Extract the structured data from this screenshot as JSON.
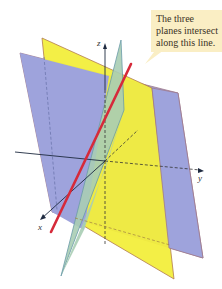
{
  "callout": {
    "lines": [
      "The three",
      "planes intersect",
      "along this line."
    ]
  },
  "axes": {
    "x_label": "x",
    "y_label": "y",
    "z_label": "z"
  },
  "colors": {
    "blue_plane": "#9ea3dc",
    "yellow_plane": "#f2ee3c",
    "green_plane": "#a8cdb4",
    "intersection_line": "#d62a3a",
    "callout_bg": "#faeec4",
    "plane_edge": "#b07a50",
    "axis": "#1e2a40"
  }
}
